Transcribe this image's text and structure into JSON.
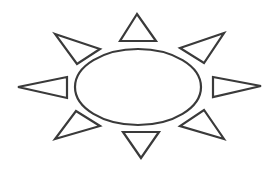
{
  "figure": {
    "width": 274,
    "height": 175,
    "background": "#ffffff",
    "stroke": "#3a3a3a",
    "stroke_width": 2.2,
    "body": {
      "shape": "ellipse",
      "cx": 138,
      "cy": 87,
      "rx": 63,
      "ry": 38
    },
    "rays": [
      {
        "name": "ray-top",
        "points": "137,14 120,41 156,41"
      },
      {
        "name": "ray-top-right",
        "points": "224,33 180,48 204,63"
      },
      {
        "name": "ray-right",
        "points": "261,86 213,77 213,97"
      },
      {
        "name": "ray-bottom-right",
        "points": "224,139 180,126 204,110"
      },
      {
        "name": "ray-bottom",
        "points": "141,158 123,132 159,132"
      },
      {
        "name": "ray-bottom-left",
        "points": "55,139 100,126 76,111"
      },
      {
        "name": "ray-left",
        "points": "18,87 67,77 67,98"
      },
      {
        "name": "ray-top-left",
        "points": "55,34 100,49 77,64"
      }
    ]
  }
}
